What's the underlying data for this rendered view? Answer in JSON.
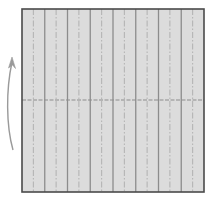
{
  "diagram": {
    "type": "origami-crease-pattern",
    "paper": {
      "x": 22,
      "y": 9,
      "width": 182,
      "height": 183,
      "fill": "#dcdcdc",
      "border_color": "#4a4a4a",
      "divisions": 16
    },
    "crease_lines": {
      "valley_color": "#8c8c8c",
      "mountain_color": "#b4b4b4",
      "pattern": "alternating solid and dash-dot vertical creases"
    },
    "center_fold": {
      "orientation": "horizontal",
      "y": 100,
      "color": "#8c8c8c",
      "style": "dashed"
    },
    "arrow": {
      "description": "curved fold arrow pointing up",
      "color": "#999999"
    }
  }
}
